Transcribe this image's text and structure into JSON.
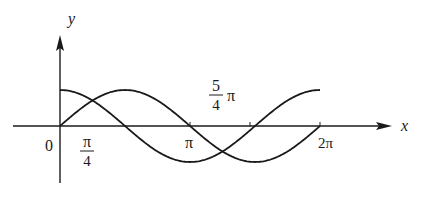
{
  "figure": {
    "axes": {
      "x_label": "x",
      "y_label": "y",
      "origin_label": "0"
    },
    "ticks": [
      {
        "id": "pi_over_4",
        "numerator": "π",
        "denominator": "4",
        "value": 0.7853981634
      },
      {
        "id": "pi",
        "label": "π",
        "value": 3.1415926536
      },
      {
        "id": "two_pi",
        "label": "2π",
        "value": 6.2831853072
      }
    ],
    "annotations": [
      {
        "id": "five_pi_over_4",
        "numerator": "5",
        "denominator": "4",
        "suffix": "π",
        "value": 3.926990817
      }
    ],
    "curves": [
      {
        "name": "sin-curve",
        "function": "y = sin x",
        "domain": [
          0,
          6.2831853072
        ]
      },
      {
        "name": "cos-curve",
        "function": "y = cos x",
        "domain": [
          0,
          6.2831853072
        ]
      }
    ],
    "colors": {
      "ink": "#1a1a1a",
      "background": "#ffffff"
    }
  },
  "chart_data": {
    "type": "line",
    "title": "",
    "xlabel": "x",
    "ylabel": "y",
    "x_ticks": [
      "0",
      "π/4",
      "π",
      "5/4 π",
      "2π"
    ],
    "xlim": [
      0,
      6.2831853072
    ],
    "ylim": [
      -1,
      1
    ],
    "grid": false,
    "series": [
      {
        "name": "sin x",
        "x": [
          0,
          0.785,
          1.571,
          2.356,
          3.142,
          3.927,
          4.712,
          5.498,
          6.283
        ],
        "values": [
          0,
          0.707,
          1,
          0.707,
          0,
          -0.707,
          -1,
          -0.707,
          0
        ]
      },
      {
        "name": "cos x",
        "x": [
          0,
          0.785,
          1.571,
          2.356,
          3.142,
          3.927,
          4.712,
          5.498,
          6.283
        ],
        "values": [
          1,
          0.707,
          0,
          -0.707,
          -1,
          -0.707,
          0,
          0.707,
          1
        ]
      }
    ],
    "annotations": [
      "intersections at π/4 and 5π/4"
    ]
  }
}
